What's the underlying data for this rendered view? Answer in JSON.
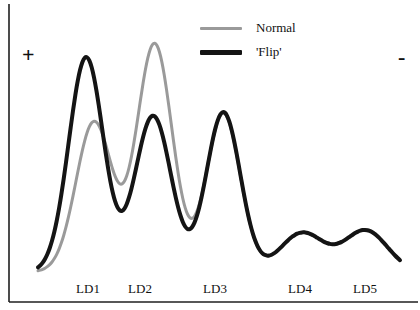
{
  "chart_data": {
    "type": "line",
    "title": "",
    "subtitle": "",
    "xlabel": "",
    "ylabel": "",
    "grid": false,
    "legend_position": "top-right",
    "categories": [
      "LD1",
      "LD2",
      "LD3",
      "LD4",
      "LD5"
    ],
    "tick_positions_px": [
      88,
      140,
      215,
      300,
      365
    ],
    "xlim": [
      0,
      1
    ],
    "ylim": [
      0,
      1
    ],
    "axis_annotations": {
      "positive_symbol": "+",
      "negative_symbol": "-"
    },
    "series": [
      {
        "name": "Normal",
        "color": "#9a9a9a",
        "line_width": 3,
        "peaks": [
          {
            "label": "LD1",
            "x": 0.155,
            "height": 0.615,
            "width": 0.05
          },
          {
            "label": "LD2",
            "x": 0.322,
            "height": 0.935,
            "width": 0.049
          },
          {
            "label": "LD3",
            "x": 0.512,
            "height": 0.65,
            "width": 0.047
          },
          {
            "label": "LD4",
            "x": 0.73,
            "height": 0.16,
            "width": 0.06
          },
          {
            "label": "LD5",
            "x": 0.905,
            "height": 0.17,
            "width": 0.06
          }
        ],
        "values": [
          0.615,
          0.935,
          0.65,
          0.16,
          0.17
        ]
      },
      {
        "name": "'Flip'",
        "color": "#141414",
        "line_width": 4,
        "peaks": [
          {
            "label": "LD1",
            "x": 0.133,
            "height": 0.88,
            "width": 0.048
          },
          {
            "label": "LD2",
            "x": 0.318,
            "height": 0.64,
            "width": 0.05
          },
          {
            "label": "LD3",
            "x": 0.512,
            "height": 0.655,
            "width": 0.047
          },
          {
            "label": "LD4",
            "x": 0.73,
            "height": 0.16,
            "width": 0.06
          },
          {
            "label": "LD5",
            "x": 0.905,
            "height": 0.17,
            "width": 0.06
          }
        ],
        "values": [
          0.88,
          0.64,
          0.655,
          0.16,
          0.17
        ]
      }
    ],
    "baseline": 0.03
  },
  "legend": {
    "items": [
      {
        "label": "Normal",
        "color": "#9a9a9a",
        "thickness": 3
      },
      {
        "label": "'Flip'",
        "color": "#141414",
        "thickness": 5
      }
    ]
  },
  "axis": {
    "positive_label": "+",
    "negative_label": "-",
    "line_color": "#1f1f1f",
    "tick_labels": [
      "LD1",
      "LD2",
      "LD3",
      "LD4",
      "LD5"
    ]
  }
}
